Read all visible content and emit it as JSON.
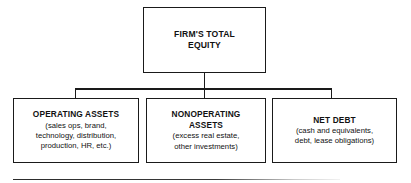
{
  "diagram": {
    "type": "hierarchy",
    "root": {
      "title": "FIRM'S TOTAL\nEQUITY"
    },
    "children": [
      {
        "title": "OPERATING ASSETS",
        "detail": "(sales ops, brand,\ntechnology, distribution,\nproduction, HR, etc.)"
      },
      {
        "title": "NONOPERATING\nASSETS",
        "detail": "(excess real estate,\nother investments)"
      },
      {
        "title": "NET DEBT",
        "detail": "(cash and equivalents,\ndebt, lease obligations)"
      }
    ],
    "colors": {
      "box_border": "#1a1a1a",
      "text": "#111111",
      "background": "#ffffff",
      "connector": "#1a1a1a"
    }
  }
}
